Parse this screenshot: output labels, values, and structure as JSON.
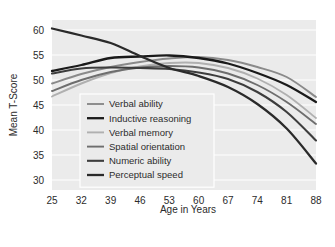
{
  "chart_data": {
    "type": "line",
    "title": "",
    "xlabel": "Age in Years",
    "ylabel": "Mean T-Score",
    "x": [
      25,
      32,
      39,
      46,
      53,
      60,
      67,
      74,
      81,
      88
    ],
    "xticklabels": [
      "25",
      "32",
      "39",
      "46",
      "53",
      "60",
      "67",
      "74",
      "81",
      "88"
    ],
    "yticklabels": [
      "30",
      "35",
      "40",
      "45",
      "50",
      "55",
      "60"
    ],
    "yticks": [
      30,
      35,
      40,
      45,
      50,
      55,
      60
    ],
    "xlim": [
      25,
      88
    ],
    "ylim": [
      28,
      62
    ],
    "grid": "horizontal",
    "legend_position": "center-left-inside",
    "plot_background": "#ebebeb",
    "gridline_color": "#ffffff",
    "series": [
      {
        "name": "Verbal ability",
        "color": "#8a8a8a",
        "width": 1.9,
        "values": [
          49.3,
          51.2,
          52.6,
          53.6,
          54.3,
          54.6,
          54.0,
          52.6,
          50.6,
          46.6
        ]
      },
      {
        "name": "Inductive reasoning",
        "color": "#1a1a1a",
        "width": 2.3,
        "values": [
          51.8,
          53.0,
          54.4,
          54.7,
          54.9,
          54.4,
          53.3,
          51.4,
          49.0,
          45.6
        ]
      },
      {
        "name": "Verbal memory",
        "color": "#b0b0b0",
        "width": 1.9,
        "values": [
          46.7,
          49.3,
          51.4,
          52.7,
          53.4,
          53.4,
          52.4,
          50.3,
          47.0,
          42.4
        ]
      },
      {
        "name": "Spatial orientation",
        "color": "#6e6e6e",
        "width": 1.9,
        "values": [
          47.8,
          50.0,
          51.6,
          52.5,
          52.8,
          52.5,
          51.3,
          49.0,
          45.6,
          41.2
        ]
      },
      {
        "name": "Numeric ability",
        "color": "#3d3d3d",
        "width": 2.1,
        "values": [
          51.3,
          52.3,
          52.5,
          52.4,
          52.2,
          51.5,
          50.2,
          47.6,
          43.6,
          37.9
        ]
      },
      {
        "name": "Perceptual speed",
        "color": "#2a2a2a",
        "width": 2.3,
        "values": [
          60.3,
          58.9,
          57.4,
          54.8,
          52.4,
          50.8,
          48.6,
          45.2,
          40.3,
          33.3
        ]
      }
    ]
  }
}
